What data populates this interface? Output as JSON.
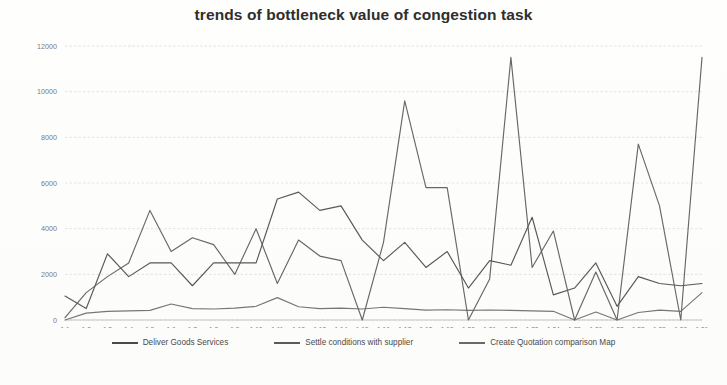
{
  "chart_data": {
    "type": "line",
    "title": "trends of bottleneck value of congestion task",
    "xlabel": "",
    "ylabel": "",
    "ylim": [
      0,
      12000
    ],
    "ytick_labels": [
      "0",
      "2000",
      "4000",
      "6000",
      "8000",
      "10000",
      "12000"
    ],
    "ytick_values": [
      0,
      2000,
      4000,
      6000,
      8000,
      10000,
      12000
    ],
    "grid": true,
    "legend_position": "bottom",
    "categories": [
      "1.1",
      "1.2",
      "1.3",
      "1.4",
      "1.5",
      "1.6",
      "1.7",
      "1.8",
      "1.9",
      "1.10",
      "1.11",
      "1.12",
      "1.13",
      "1.14",
      "1.15",
      "1.16",
      "1.17",
      "1.18",
      "1.19",
      "1.20",
      "1.21",
      "1.22",
      "1.23",
      "1.24",
      "1.25",
      "1.26",
      "1.27",
      "1.28",
      "1.29",
      "1.30",
      "1.31"
    ],
    "series": [
      {
        "name": "Deliver Goods Services",
        "color": "#4a4a4a",
        "values": [
          1050,
          500,
          2900,
          1900,
          2500,
          2500,
          1500,
          2500,
          2500,
          2500,
          5300,
          5600,
          4800,
          5000,
          3500,
          2600,
          3400,
          2300,
          3000,
          1400,
          2600,
          2400,
          4500,
          1100,
          1400,
          2500,
          600,
          1900,
          1600,
          1500,
          1600
        ]
      },
      {
        "name": "Settle conditions with supplier",
        "color": "#5a5a5a",
        "values": [
          100,
          1200,
          1900,
          2500,
          4800,
          3000,
          3600,
          3300,
          2000,
          4000,
          1600,
          3500,
          2800,
          2600,
          0,
          3400,
          9600,
          5800,
          5800,
          0,
          1800,
          11500,
          2300,
          3900,
          0,
          2100,
          0,
          7700,
          5000,
          0,
          11500
        ]
      },
      {
        "name": "Create Quotation comparison Map",
        "color": "#6a6a6a",
        "values": [
          0,
          300,
          380,
          400,
          420,
          700,
          500,
          480,
          520,
          600,
          980,
          580,
          500,
          520,
          480,
          560,
          500,
          430,
          450,
          420,
          440,
          420,
          400,
          380,
          0,
          350,
          0,
          330,
          430,
          380,
          1200
        ]
      }
    ]
  },
  "legend": {
    "items": [
      {
        "label": "Deliver Goods Services",
        "color": "#4a4a4a"
      },
      {
        "label": "Settle conditions with supplier",
        "color": "#5a5a5a"
      },
      {
        "label": "Create Quotation comparison Map",
        "color": "#6a6a6a"
      }
    ]
  },
  "caption": {
    "text": ""
  }
}
